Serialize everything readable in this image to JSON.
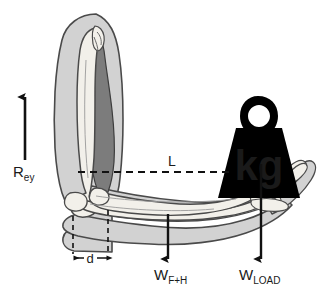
{
  "figure": {
    "type": "biomechanics-free-body-diagram",
    "background_color": "#ffffff"
  },
  "colors": {
    "skin_fill": "#d2d2d2",
    "skin_stroke": "#4a4a4a",
    "muscle_fill": "#7c7c7c",
    "muscle_stroke": "#3d3d3d",
    "bone_fill": "#f2f0ea",
    "bone_stroke": "#4a4a4a",
    "weight_fill": "#000000",
    "kg_text_color": "#ffffff",
    "arrow_color": "#111111",
    "dashed_color": "#111111"
  },
  "labels": {
    "reaction_force": {
      "symbol": "R",
      "subscript": "ey",
      "full": "Rey",
      "meaning": "elbow joint reaction force"
    },
    "moment_arm_load": {
      "symbol": "L",
      "full": "L",
      "meaning": "moment arm of the load"
    },
    "moment_arm_muscle": {
      "symbol": "d",
      "full": "d",
      "meaning": "moment arm of the muscle"
    },
    "forearm_hand_weight": {
      "symbol": "W",
      "subscript": "F+H",
      "full": "WF+H",
      "meaning": "weight of forearm and hand"
    },
    "load_weight": {
      "symbol": "W",
      "subscript": "LOAD",
      "full": "WLOAD",
      "meaning": "weight of the external load"
    },
    "weight_unit": "kg"
  },
  "anatomy": {
    "upper_arm": "upper arm",
    "humerus": "humerus",
    "biceps": "biceps brachii muscle",
    "forearm": "forearm",
    "radius": "radius",
    "ulna": "ulna",
    "hand": "hand",
    "elbow": "elbow joint"
  },
  "vectors": [
    {
      "name": "Rey",
      "direction": "up",
      "x": 25,
      "y_start": 160,
      "y_end": 95
    },
    {
      "name": "WF+H",
      "direction": "down",
      "x": 168,
      "y_start": 214,
      "y_end": 261
    },
    {
      "name": "WLOAD",
      "direction": "down",
      "x": 261,
      "y_start": 164,
      "y_end": 261
    }
  ],
  "dimensions": {
    "L_line": {
      "y": 172,
      "x_start": 78,
      "x_end": 231
    },
    "d_span": {
      "y": 258,
      "x_start": 73,
      "x_end": 108
    }
  }
}
